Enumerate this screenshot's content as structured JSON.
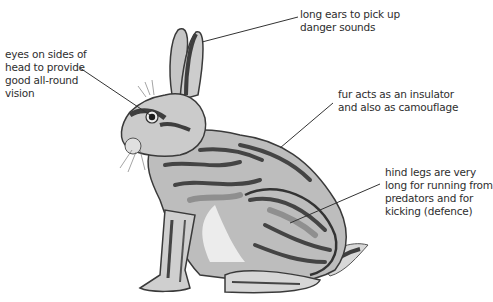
{
  "diagram": {
    "labels": {
      "ears": "long ears to pick up\ndanger sounds",
      "eyes": "eyes on sides of\nhead to provide\ngood all-round\nvision",
      "fur": "fur acts as an insulator\nand also as camouflage",
      "legs": "hind legs are very\nlong for running from\npredators and for\nkicking (defence)"
    },
    "colors": {
      "dark": "#4a4a4a",
      "mid": "#9a9a9a",
      "light": "#c8c8c8",
      "pale": "#e6e6e6",
      "text": "#2e2e2e",
      "line": "#333333"
    }
  }
}
